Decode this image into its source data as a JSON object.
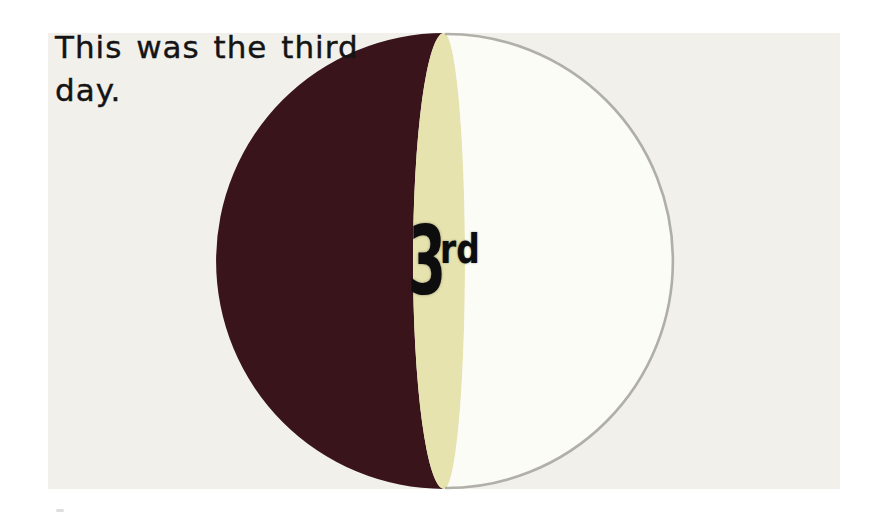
{
  "page": {
    "background": "#ffffff",
    "slide_background": "#f1f0eb"
  },
  "caption": {
    "text": "This was the third day.",
    "color": "#141414"
  },
  "diagram": {
    "label": {
      "number": "3",
      "suffix": "rd",
      "color": "#0d0d0d"
    },
    "segments": [
      {
        "name": "left-dark-segment",
        "color": "#3a141b"
      },
      {
        "name": "center-sliver-segment",
        "color": "#e7e3af"
      },
      {
        "name": "right-light-segment",
        "color": "#fcfcf6"
      }
    ],
    "rim_color": "#a3a29b"
  },
  "artifact": {
    "color": "#c2c2c0"
  }
}
